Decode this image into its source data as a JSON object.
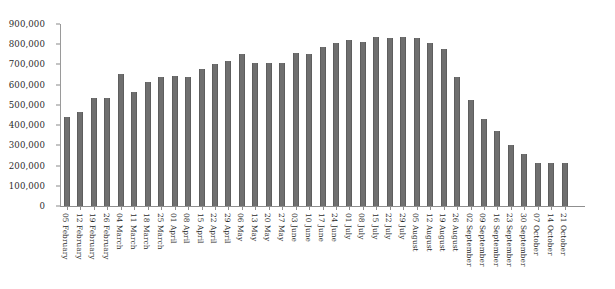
{
  "chart_data": {
    "type": "bar",
    "title": "",
    "subtitle": "",
    "xlabel": "",
    "ylabel": "",
    "ylim": [
      0,
      900000
    ],
    "ytick_values": [
      0,
      100000,
      200000,
      300000,
      400000,
      500000,
      600000,
      700000,
      800000,
      900000
    ],
    "ytick_labels": [
      "0",
      "100,000",
      "200,000",
      "300,000",
      "400,000",
      "500,000",
      "600,000",
      "700,000",
      "800,000",
      "900,000"
    ],
    "grid": false,
    "legend": null,
    "legend_position": "none",
    "bar_color": "#6f6f6f",
    "axis_color": "#8f8f8f",
    "text_color": "#2b2b2b",
    "background": "#ffffff",
    "categories": [
      "05 February",
      "12 February",
      "19 February",
      "26 February",
      "04 March",
      "11 March",
      "18 March",
      "25 March",
      "01 April",
      "08 April",
      "15 April",
      "22 April",
      "29 April",
      "06 May",
      "13 May",
      "20 May",
      "27 May",
      "03 June",
      "10 June",
      "17 June",
      "24 June",
      "01 July",
      "08 July",
      "15 July",
      "22 July",
      "29 July",
      "05 August",
      "12 August",
      "19 August",
      "26 August",
      "02 September",
      "09 September",
      "16 September",
      "23 September",
      "30 September",
      "07 October",
      "14 October",
      "21 October"
    ],
    "values": [
      440000,
      463000,
      535000,
      535000,
      655000,
      565000,
      615000,
      640000,
      645000,
      640000,
      680000,
      700000,
      715000,
      750000,
      705000,
      705000,
      705000,
      755000,
      750000,
      785000,
      805000,
      820000,
      810000,
      835000,
      830000,
      835000,
      830000,
      805000,
      775000,
      640000,
      525000,
      430000,
      370000,
      300000,
      255000,
      215000,
      212000,
      215000
    ]
  }
}
